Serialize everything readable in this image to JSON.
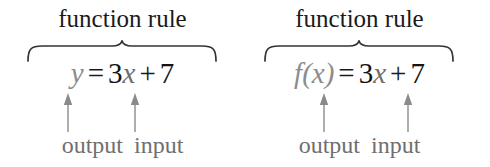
{
  "figure": {
    "background_color": "#ffffff",
    "colors": {
      "heading_text": "#1a1a1a",
      "equation_black": "#141414",
      "variable_gray": "#8c8c8c",
      "arrow_gray": "#8a8a8a",
      "legend_gray": "#6f6f6f",
      "brace_stroke": "#333333"
    }
  },
  "diagrams": [
    {
      "id": "y-notation",
      "heading": "function rule",
      "equation": {
        "output": "y",
        "equals": "=",
        "coefficient": "3",
        "input": "x",
        "plus": "+",
        "constant": "7",
        "full_text": "y = 3x + 7"
      },
      "callouts": {
        "output_label": "output",
        "input_label": "input"
      }
    },
    {
      "id": "function-notation",
      "heading": "function rule",
      "equation": {
        "output": "f(x)",
        "equals": "=",
        "coefficient": "3",
        "input": "x",
        "plus": "+",
        "constant": "7",
        "full_text": "f(x) = 3x + 7"
      },
      "callouts": {
        "output_label": "output",
        "input_label": "input"
      }
    }
  ]
}
